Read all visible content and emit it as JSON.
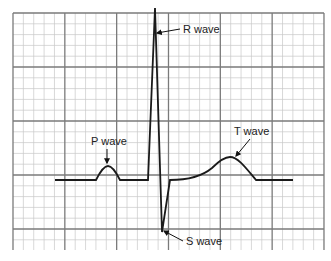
{
  "diagram": {
    "grid": {
      "left": 13,
      "top": 13,
      "right": 324,
      "bottom": 250,
      "major_x": 51.83,
      "major_y": 54,
      "minor_per_major": 5,
      "minor_color": "#c8c8c8",
      "major_color": "#7a7a7a"
    },
    "trace": {
      "color": "#1a1a1a",
      "baseline_y": 180
    },
    "labels": {
      "p_wave": "P wave",
      "r_wave": "R wave",
      "s_wave": "S wave",
      "t_wave": "T wave"
    }
  }
}
